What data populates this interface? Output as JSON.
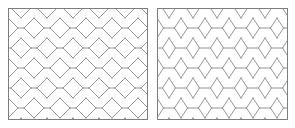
{
  "figure": {
    "width": 295,
    "height": 128,
    "background_color": "#ffffff",
    "line_color": "#8a8a8a",
    "border_color": "#7d7d7d",
    "panel_count": 2
  },
  "panels": [
    {
      "id": "panel-left",
      "name": "undeformed-honeycomb-lattice",
      "description": "Regular hexagonal honeycomb lattice",
      "x": 8,
      "y": 8,
      "width": 140,
      "height": 112,
      "lattice": {
        "type": "regular-hexagon",
        "columns": 6,
        "rows": 7,
        "cell_width": 26,
        "cell_height": 20,
        "strut_length": 6,
        "orientation": "flat-top-horizontal-strut"
      }
    },
    {
      "id": "panel-right",
      "name": "deformed-honeycomb-lattice",
      "description": "Vertically stretched honeycomb lattice with horizontal connector bars",
      "x": 157,
      "y": 8,
      "width": 131,
      "height": 112,
      "lattice": {
        "type": "stretched-hexagon",
        "columns": 6,
        "rows": 7,
        "cell_width": 24,
        "cell_height": 20,
        "strut_length": 11,
        "orientation": "flat-top-horizontal-strut"
      }
    }
  ],
  "chart_data": {
    "type": "diagram",
    "title": "",
    "subtitle": "",
    "xlabel": "",
    "ylabel": "",
    "annotations": [],
    "legend": [],
    "series": [
      {
        "name": "undeformed-lattice",
        "panel": "left",
        "cell_aspect_ratio": 1.0,
        "strut_ratio": 0.23
      },
      {
        "name": "deformed-lattice",
        "panel": "right",
        "cell_aspect_ratio": 1.0,
        "strut_ratio": 0.46
      }
    ]
  }
}
